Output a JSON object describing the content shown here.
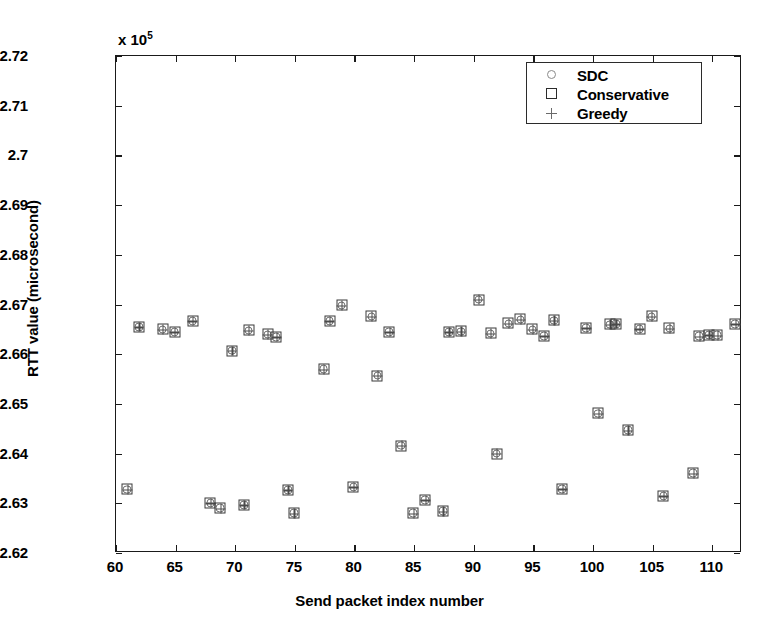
{
  "figure": {
    "width": 779,
    "height": 633,
    "background": "#ffffff",
    "axes_color": "#1a1a1a",
    "marker_color": "#3a3a3a"
  },
  "chart_data": {
    "type": "scatter",
    "title": "",
    "xlabel": "Send packet index number",
    "ylabel": "RTT value (microsecond)",
    "y_multiplier_label": "x 10",
    "y_multiplier_exponent": "5",
    "y_scale_factor": 100000,
    "xlim": [
      60,
      112.5
    ],
    "ylim": [
      2.62,
      2.72
    ],
    "xticks": [
      60,
      65,
      70,
      75,
      80,
      85,
      90,
      95,
      100,
      105,
      110
    ],
    "xticklabels": [
      "60",
      "65",
      "70",
      "75",
      "80",
      "85",
      "90",
      "95",
      "100",
      "105",
      "110"
    ],
    "yticks": [
      2.62,
      2.63,
      2.64,
      2.65,
      2.66,
      2.67,
      2.68,
      2.69,
      2.7,
      2.71,
      2.72
    ],
    "yticklabels": [
      "2.62",
      "2.63",
      "2.64",
      "2.65",
      "2.66",
      "2.67",
      "2.68",
      "2.69",
      "2.7",
      "2.71",
      "2.72"
    ],
    "grid": false,
    "legend_position": "upper right",
    "legend": [
      {
        "label": "SDC",
        "marker": "circle"
      },
      {
        "label": "Conservative",
        "marker": "square"
      },
      {
        "label": "Greedy",
        "marker": "plus"
      }
    ],
    "note": "All three series (SDC, Conservative, Greedy) plot at identical coordinates, so markers overlap into combined circle+square+plus glyphs.",
    "series": [
      {
        "name": "SDC",
        "marker": "circle",
        "x": [
          61,
          62,
          64,
          65,
          66.5,
          68,
          68.8,
          69.8,
          70.8,
          71.2,
          72.8,
          73.5,
          74.5,
          75,
          77.5,
          78,
          79,
          80,
          81.5,
          82,
          83,
          84,
          85,
          86,
          87.5,
          88,
          89,
          90.5,
          91.5,
          92,
          93,
          94,
          95,
          96,
          96.8,
          97.5,
          99.5,
          100.5,
          101.5,
          102,
          103,
          104,
          105,
          106,
          106.5,
          108.5,
          109,
          109.8,
          110.5,
          112
        ],
        "y": [
          2.6326,
          2.6653,
          2.6648,
          2.6643,
          2.6665,
          2.6299,
          2.6288,
          2.6605,
          2.6295,
          2.6646,
          2.6638,
          2.6633,
          2.6325,
          2.6278,
          2.6568,
          2.6665,
          2.6696,
          2.6331,
          2.6674,
          2.6555,
          2.6643,
          2.6414,
          2.6278,
          2.6305,
          2.6282,
          2.6643,
          2.6644,
          2.6708,
          2.664,
          2.6398,
          2.666,
          2.6668,
          2.6648,
          2.6635,
          2.6666,
          2.6327,
          2.6651,
          2.6479,
          2.6658,
          2.6659,
          2.6445,
          2.6649,
          2.6674,
          2.6313,
          2.665,
          2.6359,
          2.6634,
          2.6637,
          2.6636,
          2.6659
        ]
      },
      {
        "name": "Conservative",
        "marker": "square",
        "x": [
          61,
          62,
          64,
          65,
          66.5,
          68,
          68.8,
          69.8,
          70.8,
          71.2,
          72.8,
          73.5,
          74.5,
          75,
          77.5,
          78,
          79,
          80,
          81.5,
          82,
          83,
          84,
          85,
          86,
          87.5,
          88,
          89,
          90.5,
          91.5,
          92,
          93,
          94,
          95,
          96,
          96.8,
          97.5,
          99.5,
          100.5,
          101.5,
          102,
          103,
          104,
          105,
          106,
          106.5,
          108.5,
          109,
          109.8,
          110.5,
          112
        ],
        "y": [
          2.6326,
          2.6653,
          2.6648,
          2.6643,
          2.6665,
          2.6299,
          2.6288,
          2.6605,
          2.6295,
          2.6646,
          2.6638,
          2.6633,
          2.6325,
          2.6278,
          2.6568,
          2.6665,
          2.6696,
          2.6331,
          2.6674,
          2.6555,
          2.6643,
          2.6414,
          2.6278,
          2.6305,
          2.6282,
          2.6643,
          2.6644,
          2.6708,
          2.664,
          2.6398,
          2.666,
          2.6668,
          2.6648,
          2.6635,
          2.6666,
          2.6327,
          2.6651,
          2.6479,
          2.6658,
          2.6659,
          2.6445,
          2.6649,
          2.6674,
          2.6313,
          2.665,
          2.6359,
          2.6634,
          2.6637,
          2.6636,
          2.6659
        ]
      },
      {
        "name": "Greedy",
        "marker": "plus",
        "x": [
          61,
          62,
          64,
          65,
          66.5,
          68,
          68.8,
          69.8,
          70.8,
          71.2,
          72.8,
          73.5,
          74.5,
          75,
          77.5,
          78,
          79,
          80,
          81.5,
          82,
          83,
          84,
          85,
          86,
          87.5,
          88,
          89,
          90.5,
          91.5,
          92,
          93,
          94,
          95,
          96,
          96.8,
          97.5,
          99.5,
          100.5,
          101.5,
          102,
          103,
          104,
          105,
          106,
          106.5,
          108.5,
          109,
          109.8,
          110.5,
          112
        ],
        "y": [
          2.6326,
          2.6653,
          2.6648,
          2.6643,
          2.6665,
          2.6299,
          2.6288,
          2.6605,
          2.6295,
          2.6646,
          2.6638,
          2.6633,
          2.6325,
          2.6278,
          2.6568,
          2.6665,
          2.6696,
          2.6331,
          2.6674,
          2.6555,
          2.6643,
          2.6414,
          2.6278,
          2.6305,
          2.6282,
          2.6643,
          2.6644,
          2.6708,
          2.664,
          2.6398,
          2.666,
          2.6668,
          2.6648,
          2.6635,
          2.6666,
          2.6327,
          2.6651,
          2.6479,
          2.6658,
          2.6659,
          2.6445,
          2.6649,
          2.6674,
          2.6313,
          2.665,
          2.6359,
          2.6634,
          2.6637,
          2.6636,
          2.6659
        ]
      }
    ]
  }
}
